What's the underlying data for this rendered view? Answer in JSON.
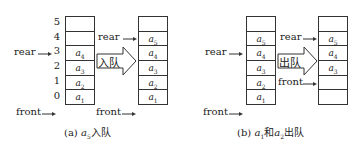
{
  "panel_a": {
    "indices": [
      "5",
      "4",
      "3",
      "2",
      "1",
      "0"
    ],
    "left_queue": [
      "",
      "",
      "a4",
      "a3",
      "a2",
      "a1"
    ],
    "right_queue": [
      "",
      "a5",
      "a4",
      "a3",
      "a2",
      "a1"
    ],
    "arrow_label": "入队",
    "labels": {
      "rear_left": "rear",
      "front_left": "front",
      "rear_right": "rear",
      "front_right": "front"
    },
    "caption_prefix": "(a)",
    "caption_var": "a",
    "caption_sub": "5",
    "caption_suffix": "入队"
  },
  "panel_b": {
    "left_queue": [
      "",
      "a5",
      "a4",
      "a3",
      "a2",
      "a1"
    ],
    "right_queue": [
      "",
      "a5",
      "a4",
      "a3",
      "",
      ""
    ],
    "arrow_label": "出队",
    "labels": {
      "rear_left": "rear",
      "front_left": "front",
      "rear_right": "rear",
      "front_right": "front"
    },
    "caption_prefix": "(b)",
    "caption_var1": "a",
    "caption_sub1": "1",
    "caption_mid": "和",
    "caption_var2": "a",
    "caption_sub2": "2",
    "caption_suffix": "出队"
  }
}
